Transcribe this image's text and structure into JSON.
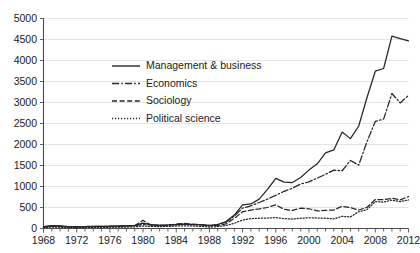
{
  "chart_data": {
    "type": "line",
    "title": "",
    "xlabel": "",
    "ylabel": "",
    "xlim": [
      1968,
      2012
    ],
    "ylim": [
      0,
      5000
    ],
    "y_ticks": [
      0,
      500,
      1000,
      1500,
      2000,
      2500,
      3000,
      3500,
      4000,
      4500,
      5000
    ],
    "x_ticks": [
      1968,
      1972,
      1976,
      1980,
      1984,
      1988,
      1992,
      1996,
      2000,
      2004,
      2008,
      2012
    ],
    "x_tick_step_minor": 1,
    "grid": "horizontal",
    "legend_position": "upper-left-inside",
    "x": [
      1968,
      1969,
      1970,
      1971,
      1972,
      1973,
      1974,
      1975,
      1976,
      1977,
      1978,
      1979,
      1980,
      1981,
      1982,
      1983,
      1984,
      1985,
      1986,
      1987,
      1988,
      1989,
      1990,
      1991,
      1992,
      1993,
      1994,
      1995,
      1996,
      1997,
      1998,
      1999,
      2000,
      2001,
      2002,
      2003,
      2004,
      2005,
      2006,
      2007,
      2008,
      2009,
      2010,
      2011,
      2012
    ],
    "series": [
      {
        "name": "Management & business",
        "style": "solid",
        "color": "#262626",
        "values": [
          45,
          70,
          60,
          45,
          40,
          45,
          50,
          50,
          55,
          60,
          65,
          75,
          130,
          95,
          80,
          85,
          95,
          105,
          95,
          90,
          75,
          95,
          165,
          320,
          565,
          585,
          700,
          930,
          1195,
          1105,
          1095,
          1215,
          1390,
          1540,
          1800,
          1870,
          2295,
          2140,
          2440,
          3120,
          3745,
          3810,
          4580,
          4520,
          4465
        ]
      },
      {
        "name": "Economics",
        "style": "dashdot",
        "color": "#262626",
        "values": [
          40,
          60,
          55,
          45,
          40,
          45,
          50,
          50,
          50,
          55,
          60,
          70,
          95,
          85,
          75,
          80,
          90,
          100,
          90,
          85,
          70,
          90,
          150,
          295,
          485,
          540,
          620,
          700,
          790,
          885,
          960,
          1060,
          1110,
          1200,
          1290,
          1390,
          1375,
          1620,
          1510,
          2070,
          2550,
          2605,
          3215,
          2990,
          3170
        ]
      },
      {
        "name": "Sociology",
        "style": "dashed",
        "color": "#4d4d4d",
        "values": [
          35,
          55,
          50,
          40,
          35,
          40,
          45,
          45,
          45,
          50,
          55,
          65,
          195,
          70,
          65,
          70,
          110,
          120,
          105,
          90,
          60,
          70,
          110,
          240,
          400,
          440,
          465,
          500,
          565,
          455,
          430,
          485,
          470,
          420,
          430,
          440,
          530,
          495,
          440,
          505,
          690,
          685,
          720,
          680,
          760
        ]
      },
      {
        "name": "Political science",
        "style": "dotted",
        "color": "#4d4d4d",
        "values": [
          20,
          35,
          30,
          25,
          20,
          25,
          25,
          25,
          30,
          30,
          35,
          40,
          60,
          50,
          45,
          50,
          60,
          65,
          60,
          50,
          35,
          45,
          70,
          125,
          200,
          235,
          245,
          250,
          260,
          235,
          225,
          245,
          255,
          250,
          245,
          230,
          290,
          275,
          400,
          450,
          640,
          630,
          675,
          640,
          680
        ]
      }
    ]
  },
  "legend": {
    "items": [
      {
        "label": "Management & business"
      },
      {
        "label": "Economics"
      },
      {
        "label": "Sociology"
      },
      {
        "label": "Political science"
      }
    ]
  },
  "axes": {
    "y_labels": [
      "5000",
      "4500",
      "4000",
      "3500",
      "3000",
      "2500",
      "2000",
      "1500",
      "1000",
      "500",
      "0"
    ],
    "x_labels": [
      "1968",
      "1972",
      "1976",
      "1980",
      "1984",
      "1988",
      "1992",
      "1996",
      "2000",
      "2004",
      "2008",
      "2012"
    ]
  }
}
